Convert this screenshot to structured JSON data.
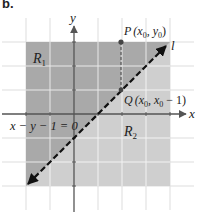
{
  "panel_label": "b.",
  "axes": {
    "x_label": "x",
    "y_label": "y"
  },
  "regions": {
    "r1": {
      "label": "R",
      "subscript": "1",
      "color": "#a9a9a9"
    },
    "r2": {
      "label": "R",
      "subscript": "2",
      "color": "#cfcfcf"
    }
  },
  "line": {
    "label": "l",
    "equation": "x − y − 1 = 0",
    "style": "dashed",
    "color": "#111111"
  },
  "points": {
    "P": {
      "name": "P",
      "coords": "(x",
      "sub0": "0",
      "mid": ", y",
      "sub1": "0",
      "end": ")"
    },
    "Q": {
      "name": "Q",
      "coords": "(x",
      "sub0": "0",
      "mid": ", x",
      "sub1": "0",
      "end": " − 1)"
    }
  },
  "colors": {
    "grid": "#ffffff",
    "axis": "#555555",
    "background": "#ffffff",
    "point": "#444444"
  }
}
